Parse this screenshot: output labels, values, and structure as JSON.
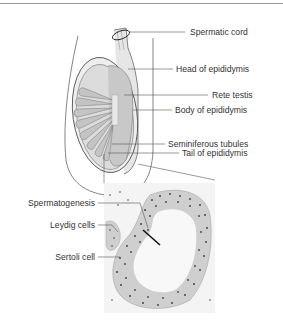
{
  "diagram": {
    "labels_right": [
      {
        "id": "spermatic-cord",
        "text": "Spermatic cord"
      },
      {
        "id": "head-of-epididymis",
        "text": "Head of epididymis"
      },
      {
        "id": "rete-testis",
        "text": "Rete testis"
      },
      {
        "id": "body-of-epididymis",
        "text": "Body of epididymis"
      },
      {
        "id": "seminiferous-tubules",
        "text": "Seminiferous tubules"
      },
      {
        "id": "tail-of-epididymis",
        "text": "Tail of epididymis"
      }
    ],
    "labels_left": [
      {
        "id": "spermatogenesis",
        "text": "Spermatogenesis"
      },
      {
        "id": "leydig-cells",
        "text": "Leydig cells"
      },
      {
        "id": "sertoli-cell",
        "text": "Sertoli cell"
      }
    ],
    "colors": {
      "line": "#555555",
      "tissue_fill": "#d8d8d8",
      "tunica_fill": "#eeeeee",
      "cell_dots": "#444444"
    }
  }
}
